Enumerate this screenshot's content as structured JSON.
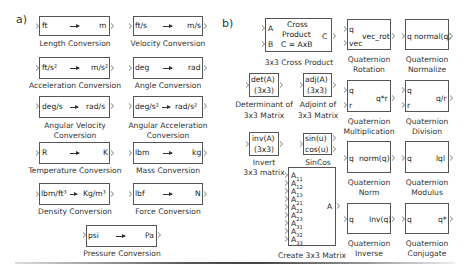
{
  "sections": {
    "a": {
      "label": "a)"
    },
    "b": {
      "label": "b)"
    }
  },
  "conversions": [
    {
      "from": "ft",
      "to": "m",
      "caption": [
        "Length Conversion"
      ]
    },
    {
      "from": "ft/s",
      "to": "m/s",
      "caption": [
        "Velocity Conversion"
      ]
    },
    {
      "from": "ft/s²",
      "to": "m/s²",
      "caption": [
        "Acceleration Conversion"
      ]
    },
    {
      "from": "deg",
      "to": "rad",
      "caption": [
        "Angle Conversion"
      ]
    },
    {
      "from": "deg/s",
      "to": "rad/s",
      "caption": [
        "Angular Velocity",
        "Conversion"
      ]
    },
    {
      "from": "deg/s²",
      "to": "rad/s²",
      "caption": [
        "Angular Acceleration",
        "Conversion"
      ]
    },
    {
      "from": "R",
      "to": "K",
      "caption": [
        "Temperature Conversion"
      ]
    },
    {
      "from": "lbm",
      "to": "kg",
      "caption": [
        "Mass Conversion"
      ]
    },
    {
      "from": "lbm/ft³",
      "to": "Kg/m³",
      "caption": [
        "Density Conversion"
      ]
    },
    {
      "from": "lbf",
      "to": "N",
      "caption": [
        "Force Conversion"
      ]
    },
    {
      "from": "psi",
      "to": "Pa",
      "caption": [
        "Pressure Conversion"
      ]
    }
  ],
  "matrix_blocks": {
    "cross_product": {
      "in1": "A",
      "in2": "B",
      "title1": "Cross",
      "title2": "Product",
      "title3": "C = AxB",
      "out": "C",
      "caption": "3x3 Cross Product"
    },
    "determinant": {
      "line1": "det(A)",
      "line2": "(3x3)",
      "caption": [
        "Determinant of",
        "3x3 Matrix"
      ]
    },
    "adjoint": {
      "line1": "adj(A)",
      "line2": "(3x3)",
      "caption": [
        "Adjoint of",
        "3x3 Matrix"
      ]
    },
    "invert": {
      "line1": "inv(A)",
      "line2": "(3x3)",
      "caption": [
        "Invert",
        "3x3 matrix"
      ]
    },
    "sincos": {
      "line1": "sin(u)",
      "line2": "cos(u)",
      "caption": "SinCos"
    },
    "create_matrix": {
      "inputs": [
        "A11",
        "A12",
        "A13",
        "A21",
        "A22",
        "A23",
        "A31",
        "A32",
        "A33"
      ],
      "out": "A",
      "caption": "Create 3x3 Matrix"
    }
  },
  "quaternion_blocks": [
    {
      "inputs": [
        "q",
        "vec"
      ],
      "out": "vec_rot",
      "caption": [
        "Quaternion",
        "Rotation"
      ]
    },
    {
      "inputs": [
        "q"
      ],
      "out": "normal(q)",
      "caption": [
        "Quaternion",
        "Normalize"
      ]
    },
    {
      "inputs": [
        "q",
        "r"
      ],
      "out": "q*r",
      "caption": [
        "Quaternion",
        "Multiplication"
      ]
    },
    {
      "inputs": [
        "q",
        "r"
      ],
      "out": "q/r",
      "caption": [
        "Quaternion",
        "Division"
      ]
    },
    {
      "inputs": [
        "q"
      ],
      "out": "norm(q)",
      "caption": [
        "Quaternion",
        "Norm"
      ]
    },
    {
      "inputs": [
        "q"
      ],
      "out": "lql",
      "caption": [
        "Quaternion",
        "Modulus"
      ]
    },
    {
      "inputs": [
        "q"
      ],
      "out": "Inv(q)",
      "caption": [
        "Quaternion",
        "Inverse"
      ]
    },
    {
      "inputs": [
        "q"
      ],
      "out": "q*",
      "caption": [
        "Quaternion",
        "Conjugate"
      ]
    }
  ]
}
